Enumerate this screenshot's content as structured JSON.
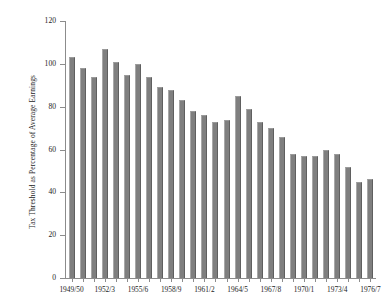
{
  "chart_data": {
    "type": "bar",
    "title": "",
    "xlabel": "",
    "ylabel": "Tax Threshold as Percentage of Average Earnings",
    "ylim": [
      0,
      120
    ],
    "yticks": [
      0,
      20,
      40,
      60,
      80,
      100,
      120
    ],
    "ytick_labels": [
      "0",
      "20",
      "40",
      "60",
      "80",
      "100",
      "120"
    ],
    "grid": false,
    "legend": "none",
    "bar_color": "#7f7f7f",
    "axis_color": "#8c8c8c",
    "categories": [
      "1949/50",
      "1950/1",
      "1951/2",
      "1952/3",
      "1953/4",
      "1954/5",
      "1955/6",
      "1956/7",
      "1957/8",
      "1958/9",
      "1959/60",
      "1960/1",
      "1961/2",
      "1962/3",
      "1963/4",
      "1964/5",
      "1965/6",
      "1966/7",
      "1967/8",
      "1968/9",
      "1969/70",
      "1970/1",
      "1971/2",
      "1972/3",
      "1973/4",
      "1974/5",
      "1975/6",
      "1976/7"
    ],
    "values": [
      103,
      98,
      94,
      107,
      101,
      95,
      100,
      94,
      89,
      88,
      83,
      78,
      76,
      73,
      74,
      85,
      79,
      73,
      70,
      66,
      58,
      57,
      57,
      60,
      58,
      52,
      45,
      46
    ],
    "xtick_labels": [
      "1949/50",
      "1952/3",
      "1955/6",
      "1958/9",
      "1961/2",
      "1964/5",
      "1967/8",
      "1970/1",
      "1973/4",
      "1976/7"
    ],
    "xtick_indices": [
      0,
      3,
      6,
      9,
      12,
      15,
      18,
      21,
      24,
      27
    ]
  }
}
